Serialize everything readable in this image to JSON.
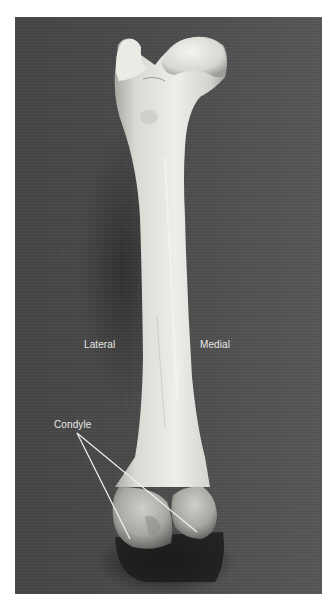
{
  "figure": {
    "background_color": "#4a4a4a",
    "bone_color": "#e6e6e0",
    "label_color": "#e8e8e8",
    "labels": {
      "lateral": "Lateral",
      "medial": "Medial",
      "condyle": "Condyle"
    }
  }
}
